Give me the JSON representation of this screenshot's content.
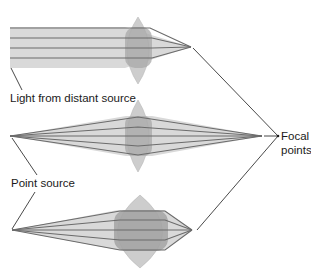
{
  "diagram": {
    "type": "lens-focusing",
    "labels": {
      "distant_source": "Light from distant source",
      "point_source": "Point source",
      "focal_line1": "Focal",
      "focal_line2": "points"
    },
    "panels": [
      {
        "name": "parallel-rays-thin-lens",
        "source": "distant",
        "lens": "thin",
        "focal_x": 191
      },
      {
        "name": "diverging-rays-thin-lens",
        "source": "point",
        "lens": "thin",
        "focal_x": 262
      },
      {
        "name": "diverging-rays-thick-lens",
        "source": "point",
        "lens": "thick",
        "focal_x": 192
      }
    ],
    "colors": {
      "beam": "#d6d6d6",
      "ray": "#6a6a6a",
      "lens": "#cfcfcf",
      "lens_overlap": "#a9a9a9",
      "leader": "#1a1a1a"
    }
  }
}
